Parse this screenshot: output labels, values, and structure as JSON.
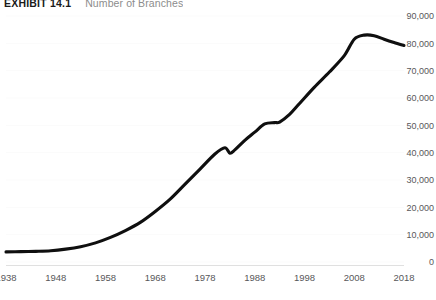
{
  "header": {
    "exhibit_label": "EXHIBIT 14.1",
    "subtitle": "Number of Branches"
  },
  "chart_data": {
    "type": "line",
    "title": "EXHIBIT 14.1",
    "subtitle": "Number of Branches",
    "xlabel": "",
    "ylabel": "",
    "grid": true,
    "legend": false,
    "legend_position": "none",
    "y_axis_position": "right",
    "xlim": [
      1938,
      2018
    ],
    "ylim": [
      0,
      90000
    ],
    "ytick_labels": [
      "90,000",
      "80,000",
      "70,000",
      "60,000",
      "50,000",
      "40,000",
      "30,000",
      "20,000",
      "10,000",
      "0"
    ],
    "ytick_values": [
      90000,
      80000,
      70000,
      60000,
      50000,
      40000,
      30000,
      20000,
      10000,
      0
    ],
    "xtick_labels": [
      "1938",
      "1948",
      "1958",
      "1968",
      "1978",
      "1988",
      "1998",
      "2008",
      "2018"
    ],
    "xtick_values": [
      1938,
      1948,
      1958,
      1968,
      1978,
      1988,
      1998,
      2008,
      2018
    ],
    "series": [
      {
        "name": "Number of Branches",
        "color": "#0f0f0f",
        "x": [
          1938,
          1941,
          1944,
          1947,
          1950,
          1953,
          1956,
          1959,
          1962,
          1965,
          1968,
          1971,
          1974,
          1977,
          1980,
          1982,
          1983,
          1984,
          1986,
          1988,
          1990,
          1992,
          1993,
          1995,
          1997,
          2000,
          2003,
          2006,
          2008,
          2010,
          2012,
          2014,
          2016,
          2018
        ],
        "values": [
          3700,
          3800,
          3900,
          4100,
          4700,
          5600,
          7000,
          9000,
          11500,
          14500,
          18500,
          23000,
          28500,
          34000,
          39500,
          41800,
          39800,
          41000,
          44500,
          47500,
          50500,
          51000,
          51200,
          54000,
          58000,
          64000,
          69500,
          75500,
          81500,
          83000,
          82800,
          81500,
          80300,
          79200
        ]
      }
    ],
    "annotations": []
  }
}
